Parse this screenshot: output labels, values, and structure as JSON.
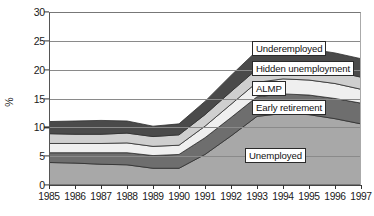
{
  "chart_data": {
    "type": "area",
    "stacked": true,
    "title": "",
    "subtitle": "",
    "xlabel": "",
    "ylabel": "%",
    "ylim": [
      0,
      30
    ],
    "yticks": [
      0,
      5,
      10,
      15,
      20,
      25,
      30
    ],
    "grid": true,
    "legend_position": "inline-labels",
    "categories": [
      "1985",
      "1986",
      "1987",
      "1988",
      "1989",
      "1990",
      "1991",
      "1992",
      "1993",
      "1994",
      "1995",
      "1996",
      "1997"
    ],
    "series": [
      {
        "name": "Unemployed",
        "color": "#a8a8a8",
        "values": [
          3.9,
          3.8,
          3.6,
          3.5,
          2.9,
          2.9,
          5.3,
          8.5,
          11.9,
          12.4,
          12.2,
          11.5,
          10.6
        ]
      },
      {
        "name": "Early retirement",
        "color": "#6e6e6e",
        "values": [
          1.7,
          1.8,
          2.0,
          2.1,
          2.2,
          2.4,
          2.9,
          3.2,
          3.4,
          3.4,
          3.4,
          3.5,
          3.6
        ]
      },
      {
        "name": "ALMP",
        "color": "#efefef",
        "values": [
          1.6,
          1.6,
          1.6,
          1.7,
          1.6,
          1.6,
          2.0,
          2.3,
          2.5,
          2.6,
          2.6,
          2.6,
          2.4
        ]
      },
      {
        "name": "Hidden unemployment",
        "color": "#cfcfcf",
        "values": [
          1.7,
          1.6,
          1.6,
          1.7,
          1.7,
          1.8,
          2.0,
          2.2,
          2.3,
          2.3,
          2.2,
          2.1,
          2.1
        ]
      },
      {
        "name": "Underemployed",
        "color": "#4a4a4a",
        "values": [
          2.1,
          2.3,
          2.4,
          2.1,
          1.8,
          1.9,
          2.3,
          2.8,
          3.2,
          3.2,
          3.2,
          3.2,
          3.2
        ]
      }
    ],
    "series_totals": [
      11.0,
      11.1,
      11.2,
      11.1,
      10.2,
      10.6,
      14.5,
      19.0,
      23.3,
      23.9,
      23.6,
      22.9,
      21.9
    ]
  },
  "axis": {
    "y_label": "%",
    "y_ticks": [
      "0",
      "5",
      "10",
      "15",
      "20",
      "25",
      "30"
    ],
    "x_ticks": [
      "1985",
      "1986",
      "1987",
      "1988",
      "1989",
      "1990",
      "1991",
      "1992",
      "1993",
      "1994",
      "1995",
      "1996",
      "1997"
    ]
  },
  "labels": {
    "underemployed": "Underemployed",
    "hidden_unemployment": "Hidden unemployment",
    "almp": "ALMP",
    "early_retirement": "Early retirement",
    "unemployed": "Unemployed"
  },
  "colors": {
    "unemployed": "#a8a8a8",
    "early_retirement": "#6e6e6e",
    "almp": "#efefef",
    "hidden_unemployment": "#cfcfcf",
    "underemployed": "#4a4a4a",
    "grid": "#8a8a8a",
    "axis": "#333333",
    "text": "#1a1a1a"
  }
}
